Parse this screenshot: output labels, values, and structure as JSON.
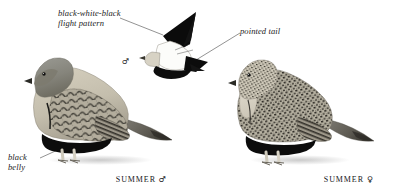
{
  "plate": {
    "title": "Black-bellied Sandgrouse plate",
    "background_color": "#ffffff",
    "ink_color": "#1c1c1c"
  },
  "annotations": [
    {
      "id": "flight-pattern",
      "text": "black-white-black\nflight pattern",
      "style": "italic",
      "leader": "line to flying bird wing"
    },
    {
      "id": "pointed-tail",
      "text": "pointed tail",
      "style": "italic",
      "leader": "line to flying bird tail"
    },
    {
      "id": "black-belly",
      "text": "black\nbelly",
      "style": "italic",
      "leader": "line to standing male belly"
    }
  ],
  "captions": {
    "male": {
      "season": "SUMMER",
      "symbol": "♂"
    },
    "female": {
      "season": "SUMMER",
      "symbol": "♀"
    },
    "flight_male_symbol": "♂"
  },
  "figures": [
    {
      "id": "flying-male",
      "pose": "flight",
      "sex": "male",
      "colors": {
        "wing": "#0d0d0d",
        "body_patch": "#fdfdfd",
        "belly": "#101010"
      }
    },
    {
      "id": "standing-male",
      "pose": "standing",
      "sex": "male",
      "colors": {
        "head": "#8d8d88",
        "throat": "#7e7a6e",
        "breast": "#c9c3b2",
        "mantle": "#a5a093",
        "scaling": "#3d3a33",
        "belly": "#0e0e0e",
        "tail": "#6e6b62",
        "leg": "#e4e1d7",
        "bill": "#2b2b2b"
      }
    },
    {
      "id": "standing-female",
      "pose": "standing",
      "sex": "female",
      "colors": {
        "head": "#bdb8a8",
        "throat": "#ded9cb",
        "body": "#b0ab9b",
        "speckling": "#312e29",
        "belly": "#0e0e0e",
        "tail": "#5e5b54",
        "leg": "#e4e1d7",
        "bill": "#2b2b2b"
      }
    }
  ]
}
